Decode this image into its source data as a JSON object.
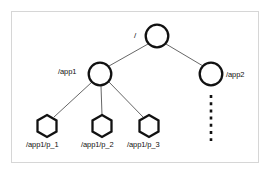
{
  "diagram": {
    "title_visible": false,
    "frame": {
      "stroke": "#d6d6d6",
      "background": "#ffffff"
    },
    "stroke_node": "#111111",
    "stroke_edge": "#555555",
    "nodes": [
      {
        "id": "root",
        "label": "/",
        "shape": "circle",
        "cx": 157,
        "cy": 36,
        "r": 11.5,
        "label_side": "left"
      },
      {
        "id": "app1",
        "label": "/app1",
        "shape": "circle",
        "cx": 100,
        "cy": 74,
        "r": 11.5,
        "label_side": "left"
      },
      {
        "id": "app2",
        "label": "/app2",
        "shape": "circle",
        "cx": 211,
        "cy": 74,
        "r": 11.5,
        "label_side": "right"
      },
      {
        "id": "p1",
        "label": "/app1/p_1",
        "shape": "hexagon",
        "cx": 47,
        "cy": 126,
        "r": 11,
        "label_side": "below"
      },
      {
        "id": "p2",
        "label": "/app1/p_2",
        "shape": "hexagon",
        "cx": 102,
        "cy": 126,
        "r": 11,
        "label_side": "below"
      },
      {
        "id": "p3",
        "label": "/app1/p_3",
        "shape": "hexagon",
        "cx": 149,
        "cy": 126,
        "r": 11,
        "label_side": "below"
      }
    ],
    "edges": [
      {
        "from": "root",
        "to": "app1",
        "style": "solid"
      },
      {
        "from": "root",
        "to": "app2",
        "style": "solid"
      },
      {
        "from": "app1",
        "to": "p1",
        "style": "solid"
      },
      {
        "from": "app1",
        "to": "p2",
        "style": "solid"
      },
      {
        "from": "app1",
        "to": "p3",
        "style": "solid"
      }
    ],
    "continuation": {
      "under": "app2",
      "style": "dashed-vertical",
      "x": 211,
      "y_start": 94,
      "y_end": 141
    }
  }
}
